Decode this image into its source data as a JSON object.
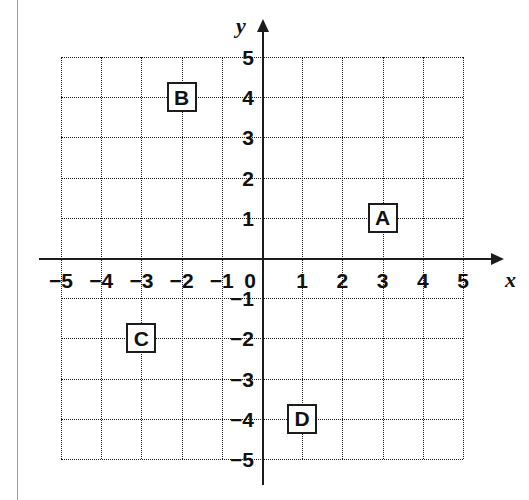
{
  "figure": {
    "type": "coordinate-plane",
    "x_axis_label": "x",
    "y_axis_label": "y",
    "origin_label": "0"
  },
  "chart_data": {
    "type": "scatter",
    "title": "",
    "xlabel": "x",
    "ylabel": "y",
    "xlim": [
      -5,
      5
    ],
    "ylim": [
      -5,
      5
    ],
    "grid": true,
    "legend": "none",
    "x_ticks": [
      "−5",
      "−4",
      "−3",
      "−2",
      "−1",
      "0",
      "1",
      "2",
      "3",
      "4",
      "5"
    ],
    "x_tick_values": [
      -5,
      -4,
      -3,
      -2,
      -1,
      0,
      1,
      2,
      3,
      4,
      5
    ],
    "y_ticks": [
      "5",
      "4",
      "3",
      "2",
      "1",
      "−1",
      "−2",
      "−3",
      "−4",
      "−5"
    ],
    "y_tick_values": [
      5,
      4,
      3,
      2,
      1,
      -1,
      -2,
      -3,
      -4,
      -5
    ],
    "points": [
      {
        "label": "A",
        "x": 3,
        "y": 1
      },
      {
        "label": "B",
        "x": -2,
        "y": 4
      },
      {
        "label": "C",
        "x": -3,
        "y": -2
      },
      {
        "label": "D",
        "x": 1,
        "y": -4
      }
    ],
    "colors": {
      "axis": "#1c1c1c",
      "grid": "#1a1a1a",
      "text": "#111111",
      "background": "#ffffff"
    }
  }
}
